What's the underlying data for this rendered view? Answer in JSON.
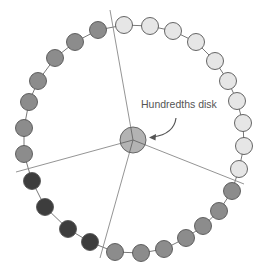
{
  "diagram": {
    "label": "Hundredths disk",
    "label_pos": {
      "x": 141,
      "y": 110
    },
    "center": {
      "x": 133,
      "y": 140,
      "r": 13,
      "fill": "#b3b3b3",
      "stroke": "#666666"
    },
    "bead_radius": 8.5,
    "colors": {
      "light": "#e6e6e6",
      "mid": "#8c8c8c",
      "dark": "#3d3d3d",
      "stroke": "#555555",
      "line": "#888888"
    },
    "dividers": [
      {
        "x2": 110,
        "y2": 10
      },
      {
        "x2": 244,
        "y2": 184
      },
      {
        "x2": 16,
        "y2": 172
      },
      {
        "x2": 100,
        "y2": 258
      }
    ],
    "beads": [
      {
        "x": 124,
        "y": 25,
        "tone": "light"
      },
      {
        "x": 150,
        "y": 26,
        "tone": "light"
      },
      {
        "x": 173,
        "y": 31,
        "tone": "light"
      },
      {
        "x": 196,
        "y": 42,
        "tone": "light"
      },
      {
        "x": 215,
        "y": 61,
        "tone": "light"
      },
      {
        "x": 228,
        "y": 81,
        "tone": "light"
      },
      {
        "x": 237,
        "y": 101,
        "tone": "light"
      },
      {
        "x": 243,
        "y": 123,
        "tone": "light"
      },
      {
        "x": 244,
        "y": 146,
        "tone": "light"
      },
      {
        "x": 239,
        "y": 169,
        "tone": "light"
      },
      {
        "x": 232,
        "y": 191,
        "tone": "mid"
      },
      {
        "x": 219,
        "y": 211,
        "tone": "mid"
      },
      {
        "x": 203,
        "y": 226,
        "tone": "mid"
      },
      {
        "x": 186,
        "y": 238,
        "tone": "mid"
      },
      {
        "x": 164,
        "y": 249,
        "tone": "mid"
      },
      {
        "x": 141,
        "y": 253,
        "tone": "mid"
      },
      {
        "x": 115,
        "y": 252,
        "tone": "mid"
      },
      {
        "x": 90,
        "y": 242,
        "tone": "dark"
      },
      {
        "x": 68,
        "y": 229,
        "tone": "dark"
      },
      {
        "x": 45,
        "y": 207,
        "tone": "dark"
      },
      {
        "x": 32,
        "y": 181,
        "tone": "dark"
      },
      {
        "x": 24,
        "y": 154,
        "tone": "mid"
      },
      {
        "x": 24,
        "y": 128,
        "tone": "mid"
      },
      {
        "x": 29,
        "y": 102,
        "tone": "mid"
      },
      {
        "x": 38,
        "y": 81,
        "tone": "mid"
      },
      {
        "x": 55,
        "y": 58,
        "tone": "mid"
      },
      {
        "x": 75,
        "y": 42,
        "tone": "mid"
      },
      {
        "x": 98,
        "y": 30,
        "tone": "mid"
      }
    ],
    "bead_counts": {
      "light": 10,
      "mid": 14,
      "dark": 4,
      "total": 28
    }
  }
}
